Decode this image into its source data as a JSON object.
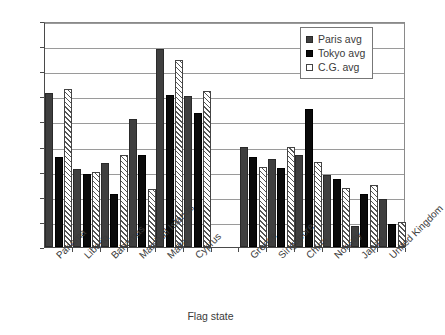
{
  "chart_data": {
    "type": "bar",
    "title": "",
    "xlabel": "Flag state",
    "ylabel": "",
    "ylim": [
      0,
      1.8
    ],
    "yticks": [
      0,
      0.2,
      0.4,
      0.6,
      0.8,
      1,
      1.2,
      1.4,
      1.6,
      1.8
    ],
    "ytick_labels": [
      "0",
      "0.2",
      "0.4",
      "0.6",
      "0.8",
      "1",
      "1.2",
      "1.4",
      "1.6",
      "1.8"
    ],
    "grid": "horizontal",
    "legend_position": "top-right",
    "categories": [
      "Panama",
      "Liberia",
      "Bahamas",
      "Marshall Islands",
      "Malta",
      "Cyprus",
      "",
      "Greece",
      "Singapore",
      "China",
      "Norway",
      "Japan",
      "United Kingdom"
    ],
    "series": [
      {
        "name": "Paris avg",
        "color": "#3f3f3f",
        "values": [
          1.23,
          0.62,
          0.67,
          1.02,
          1.58,
          1.2,
          null,
          0.8,
          0.7,
          0.73,
          0.57,
          0.17,
          0.38
        ]
      },
      {
        "name": "Tokyo avg",
        "color": "#0a0a0a",
        "values": [
          0.72,
          0.58,
          0.42,
          0.73,
          1.21,
          1.07,
          null,
          0.72,
          0.63,
          1.1,
          0.54,
          0.42,
          0.18
        ]
      },
      {
        "name": "C.G. avg",
        "color": "#ffffff",
        "values": [
          1.26,
          0.6,
          0.73,
          0.46,
          1.49,
          1.24,
          null,
          0.64,
          0.8,
          0.68,
          0.47,
          0.49,
          0.2
        ]
      }
    ]
  },
  "legend": {
    "items": [
      {
        "label": "Paris avg"
      },
      {
        "label": "Tokyo avg"
      },
      {
        "label": "C.G. avg"
      }
    ]
  }
}
